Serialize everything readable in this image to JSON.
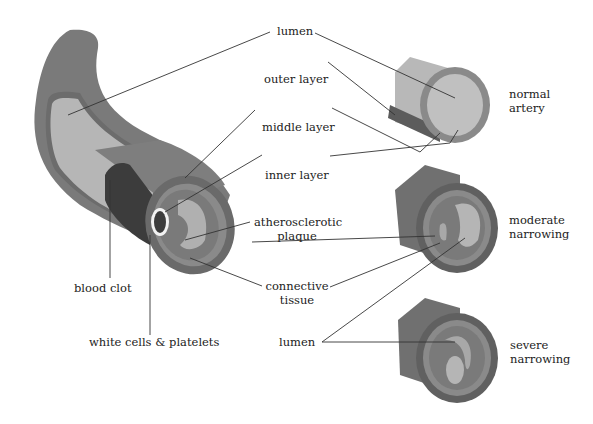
{
  "diagram": {
    "labels": {
      "lumen_top": "lumen",
      "outer_layer": "outer layer",
      "middle_layer": "middle layer",
      "inner_layer": "inner layer",
      "plaque_line1": "atherosclerotic",
      "plaque_line2": "plaque",
      "connective_line1": "connective",
      "connective_line2": "tissue",
      "lumen_bottom": "lumen",
      "blood_clot": "blood clot",
      "white_cells": "white cells & platelets",
      "normal_line1": "normal",
      "normal_line2": "artery",
      "moderate_line1": "moderate",
      "moderate_line2": "narrowing",
      "severe_line1": "severe",
      "severe_line2": "narrowing"
    },
    "colors": {
      "outer_wall": "#7a7a7a",
      "middle_wall": "#8e8e8e",
      "inner_band": "#6a6a6a",
      "lumen": "#b8b8b8",
      "plaque": "#a8a8a8",
      "clot": "#3c3c3c",
      "white_cells": "#f2f2f2",
      "line": "#333333"
    }
  }
}
